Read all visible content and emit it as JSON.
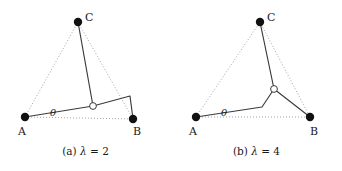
{
  "figure": {
    "panels": [
      {
        "id": "panel-a",
        "caption_prefix": "(a)",
        "caption_symbol": "λ",
        "caption_relation": "=",
        "caption_value": "2",
        "caption_full": "(a) λ = 2",
        "angle_label": "θ",
        "vertices": [
          {
            "name": "A",
            "label": "A",
            "x": 25,
            "y": 117
          },
          {
            "name": "B",
            "label": "B",
            "x": 133,
            "y": 119
          },
          {
            "name": "C",
            "label": "C",
            "x": 78,
            "y": 22
          }
        ],
        "junction": {
          "name": "junction",
          "x": 93,
          "y": 106
        },
        "bend": {
          "name": "bend",
          "x": 130,
          "y": 96
        },
        "label_positions": {
          "A": {
            "x": 18,
            "y": 126
          },
          "B": {
            "x": 133,
            "y": 126
          },
          "C": {
            "x": 85,
            "y": 12
          },
          "theta": {
            "x": 50,
            "y": 108
          }
        },
        "dotted_edges": [
          {
            "from": "A",
            "to": "C"
          },
          {
            "from": "C",
            "to": "B"
          },
          {
            "from": "A",
            "to": "B"
          }
        ],
        "solid_path": [
          "A",
          "junction",
          "bend",
          "B"
        ],
        "solid_spur": {
          "from": "junction",
          "to": "C"
        }
      },
      {
        "id": "panel-b",
        "caption_prefix": "(b)",
        "caption_symbol": "λ",
        "caption_relation": "=",
        "caption_value": "4",
        "caption_full": "(b) λ = 4",
        "angle_label": "θ",
        "vertices": [
          {
            "name": "A",
            "label": "A",
            "x": 25,
            "y": 117
          },
          {
            "name": "B",
            "label": "B",
            "x": 139,
            "y": 117
          },
          {
            "name": "C",
            "label": "C",
            "x": 89,
            "y": 22
          }
        ],
        "junction": {
          "name": "junction",
          "x": 103,
          "y": 89
        },
        "bend": {
          "name": "bend",
          "x": 91,
          "y": 107
        },
        "label_positions": {
          "A": {
            "x": 18,
            "y": 126
          },
          "B": {
            "x": 139,
            "y": 126
          },
          "C": {
            "x": 96,
            "y": 12
          },
          "theta": {
            "x": 50,
            "y": 108
          }
        },
        "dotted_edges": [
          {
            "from": "A",
            "to": "C"
          },
          {
            "from": "C",
            "to": "B"
          },
          {
            "from": "A",
            "to": "B"
          }
        ],
        "solid_path": [
          "A",
          "bend",
          "junction",
          "B"
        ],
        "solid_spur": {
          "from": "junction",
          "to": "C"
        }
      }
    ],
    "style": {
      "vertex_color": "#111111",
      "vertex_radius": 4.2,
      "junction_radius": 3.4,
      "junction_fill": "#ffffff",
      "solid_stroke": "#3a3a3a",
      "solid_width": 1.15,
      "dotted_stroke": "#9a9a9a",
      "dotted_width": 0.9,
      "dash_pattern": "1,2",
      "background": "#ffffff"
    },
    "caption_y": 146
  }
}
